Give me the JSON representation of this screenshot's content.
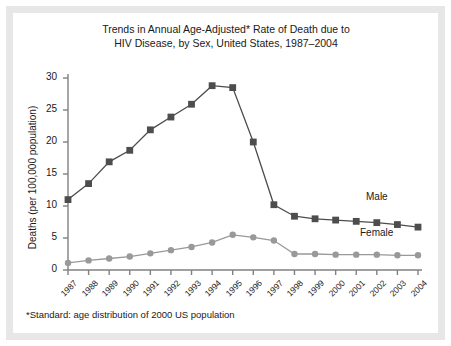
{
  "figure": {
    "title": "Trends in Annual Age-Adjusted* Rate of Death due to\nHIV Disease, by Sex, United States, 1987–2004",
    "footnote": "*Standard: age distribution of 2000 US population",
    "frame_color": "#e7e7e7",
    "background": "#ffffff"
  },
  "series_labels": {
    "male": "Male",
    "female": "Female"
  },
  "chart_data": {
    "type": "line",
    "title": "Trends in Annual Age-Adjusted* Rate of Death due to HIV Disease, by Sex, United States, 1987–2004",
    "xlabel": "",
    "ylabel": "Deaths (per 100,000 population)",
    "categories": [
      "1987",
      "1988",
      "1989",
      "1990",
      "1991",
      "1992",
      "1993",
      "1994",
      "1995",
      "1996",
      "1997",
      "1998",
      "1999",
      "2000",
      "2001",
      "2002",
      "2003",
      "2004"
    ],
    "x": [
      1987,
      1988,
      1989,
      1990,
      1991,
      1992,
      1993,
      1994,
      1995,
      1996,
      1997,
      1998,
      1999,
      2000,
      2001,
      2002,
      2003,
      2004
    ],
    "ylim": [
      0,
      30
    ],
    "yticks": [
      0,
      5,
      10,
      15,
      20,
      25,
      30
    ],
    "ytick_labels": [
      "0",
      "5",
      "10",
      "15",
      "20",
      "25",
      "30"
    ],
    "grid": false,
    "legend": "inline-right",
    "series": [
      {
        "name": "Male",
        "color": "#4d4d4d",
        "marker": "square",
        "values": [
          11.0,
          13.5,
          16.9,
          18.7,
          21.9,
          23.9,
          25.9,
          28.8,
          28.5,
          20.0,
          10.2,
          8.4,
          8.0,
          7.8,
          7.6,
          7.4,
          7.1,
          6.7
        ]
      },
      {
        "name": "Female",
        "color": "#999999",
        "marker": "circle",
        "values": [
          1.1,
          1.5,
          1.8,
          2.1,
          2.6,
          3.1,
          3.6,
          4.3,
          5.5,
          5.1,
          4.6,
          2.5,
          2.5,
          2.4,
          2.4,
          2.4,
          2.3,
          2.3
        ]
      }
    ],
    "annotations": [
      "*Standard: age distribution of 2000 US population"
    ]
  }
}
